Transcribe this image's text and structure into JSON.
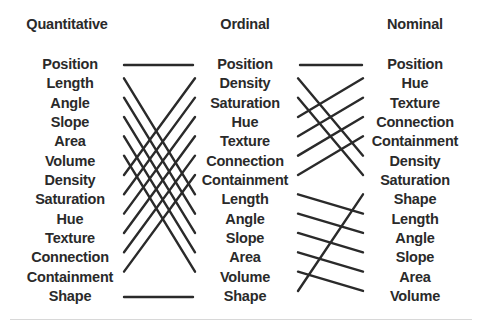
{
  "headers": {
    "quantitative": "Quantitative",
    "ordinal": "Ordinal",
    "nominal": "Nominal"
  },
  "columns": {
    "quantitative": [
      "Position",
      "Length",
      "Angle",
      "Slope",
      "Area",
      "Volume",
      "Density",
      "Saturation",
      "Hue",
      "Texture",
      "Connection",
      "Containment",
      "Shape"
    ],
    "ordinal": [
      "Position",
      "Density",
      "Saturation",
      "Hue",
      "Texture",
      "Connection",
      "Containment",
      "Length",
      "Angle",
      "Slope",
      "Area",
      "Volume",
      "Shape"
    ],
    "nominal": [
      "Position",
      "Hue",
      "Texture",
      "Connection",
      "Containment",
      "Density",
      "Saturation",
      "Shape",
      "Length",
      "Angle",
      "Slope",
      "Area",
      "Volume"
    ]
  },
  "connections": {
    "quantitative_to_ordinal": [
      [
        0,
        0
      ],
      [
        1,
        7
      ],
      [
        2,
        8
      ],
      [
        3,
        9
      ],
      [
        4,
        10
      ],
      [
        5,
        11
      ],
      [
        6,
        1
      ],
      [
        7,
        2
      ],
      [
        8,
        3
      ],
      [
        9,
        4
      ],
      [
        10,
        5
      ],
      [
        11,
        6
      ],
      [
        12,
        12
      ]
    ],
    "ordinal_to_nominal": [
      [
        0,
        0
      ],
      [
        1,
        5
      ],
      [
        2,
        6
      ],
      [
        3,
        1
      ],
      [
        4,
        2
      ],
      [
        5,
        3
      ],
      [
        6,
        4
      ],
      [
        7,
        8
      ],
      [
        8,
        9
      ],
      [
        9,
        10
      ],
      [
        10,
        11
      ],
      [
        11,
        12
      ],
      [
        12,
        7
      ]
    ]
  },
  "colors": {
    "text": "#2a2a2a",
    "line": "#2a2a2a",
    "rule": "#d8d8d8"
  }
}
